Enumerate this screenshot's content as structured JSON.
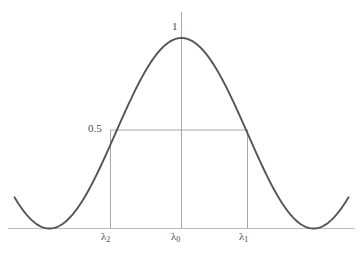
{
  "figure": {
    "background_color": "#ffffff",
    "curve_color": "#555555",
    "guide_color": "#aaaaaa",
    "axis_color": "#bbbbbb",
    "text_color": "#4a4a4a"
  },
  "labels": {
    "peak": "1",
    "half": "0.5",
    "lambda2_base": "λ",
    "lambda2_sub": "2",
    "lambda0_base": "λ",
    "lambda0_sub": "0",
    "lambda1_base": "λ",
    "lambda1_sub": "1"
  },
  "chart_data": {
    "type": "line",
    "title": "",
    "xlabel": "",
    "ylabel": "",
    "grid": false,
    "legend": null,
    "xlim": [
      -1.35,
      1.35
    ],
    "ylim": [
      0,
      1.08
    ],
    "x_ticks": [
      -0.5,
      0,
      0.5
    ],
    "x_tick_labels": [
      "λ₂",
      "λ₀",
      "λ₁"
    ],
    "y_ticks": [
      0.5,
      1
    ],
    "y_tick_labels": [
      "0.5",
      "1"
    ],
    "annotations": [
      {
        "text": "1",
        "x": 0,
        "y": 1.0,
        "role": "peak-value"
      },
      {
        "text": "0.5",
        "x": -0.5,
        "y": 0.5,
        "role": "half-maximum-value"
      },
      {
        "text": "λ₂",
        "x": -0.5,
        "y": 0,
        "role": "lower-cutoff"
      },
      {
        "text": "λ₀",
        "x": 0,
        "y": 0,
        "role": "center-wavelength"
      },
      {
        "text": "λ₁",
        "x": 0.5,
        "y": 0,
        "role": "upper-cutoff"
      }
    ],
    "guide_lines": [
      {
        "orientation": "horizontal",
        "y": 0.5,
        "x_from": -0.5,
        "x_to": 0.5
      },
      {
        "orientation": "vertical",
        "x": -0.5,
        "y_from": 0,
        "y_to": 0.5
      },
      {
        "orientation": "vertical",
        "x": 0.5,
        "y_from": 0,
        "y_to": 0.5
      },
      {
        "orientation": "vertical",
        "x": 0,
        "y_from": 0,
        "y_to": 1.08
      }
    ],
    "series": [
      {
        "name": "transmission",
        "formula": "0.5*(1+cos(pi*x))",
        "x": [
          -1.2,
          -1.1,
          -1.0,
          -0.9,
          -0.8,
          -0.7,
          -0.6,
          -0.5,
          -0.4,
          -0.3,
          -0.2,
          -0.1,
          0.0,
          0.1,
          0.2,
          0.3,
          0.4,
          0.5,
          0.6,
          0.7,
          0.8,
          0.9,
          1.0,
          1.1,
          1.2
        ],
        "y": [
          0.095,
          0.024,
          0.0,
          0.024,
          0.095,
          0.206,
          0.345,
          0.5,
          0.655,
          0.794,
          0.905,
          0.976,
          1.0,
          0.976,
          0.905,
          0.794,
          0.655,
          0.5,
          0.345,
          0.206,
          0.095,
          0.024,
          0.0,
          0.024,
          0.095
        ]
      }
    ]
  }
}
